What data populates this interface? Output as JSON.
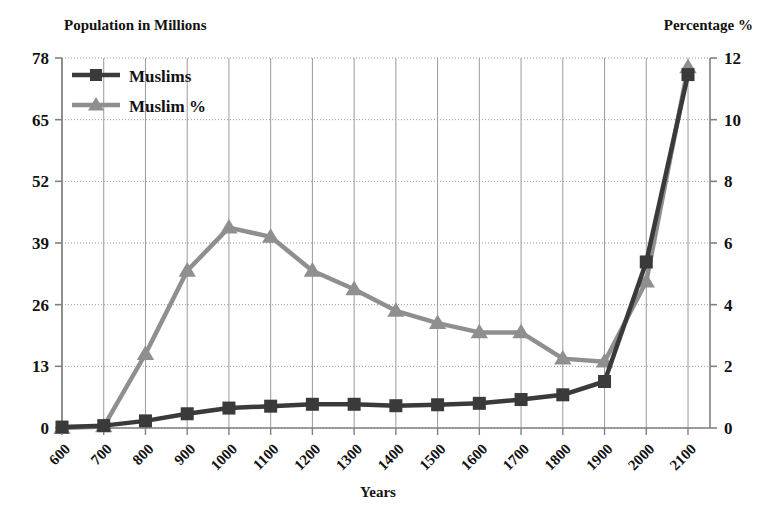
{
  "chart_data": {
    "type": "line",
    "title": "",
    "xlabel": "Years",
    "left_axis_title": "Population in Millions",
    "right_axis_title": "Percentage %",
    "categories": [
      "600",
      "700",
      "800",
      "900",
      "1000",
      "1100",
      "1200",
      "1300",
      "1400",
      "1500",
      "1600",
      "1700",
      "1800",
      "1900",
      "2000",
      "2100"
    ],
    "left_ticks": [
      "0",
      "13",
      "26",
      "39",
      "52",
      "65",
      "78"
    ],
    "right_ticks": [
      "0",
      "2",
      "4",
      "6",
      "8",
      "10",
      "12"
    ],
    "ylim": [
      0,
      78
    ],
    "y2lim": [
      0,
      12
    ],
    "grid": true,
    "legend_position": "top-left",
    "series": [
      {
        "name": "Muslims",
        "axis": "left",
        "marker": "square",
        "color": "#3a3a3a",
        "values": [
          0.2,
          0.5,
          1.5,
          3.0,
          4.2,
          4.6,
          5.0,
          5.0,
          4.7,
          4.9,
          5.2,
          6.0,
          7.0,
          9.8,
          35.0,
          74.5
        ]
      },
      {
        "name": "Muslim %",
        "axis": "right",
        "marker": "triangle",
        "color": "#8f8f8f",
        "values": [
          0.0,
          0.05,
          2.4,
          5.1,
          6.5,
          6.2,
          5.1,
          4.5,
          3.8,
          3.4,
          3.1,
          3.1,
          2.25,
          2.15,
          4.75,
          11.7
        ]
      }
    ]
  },
  "legend": {
    "items": [
      {
        "label": "Muslims"
      },
      {
        "label": "Muslim %"
      }
    ]
  },
  "colors": {
    "series_muslims": "#3a3a3a",
    "series_muslim_pct": "#8f8f8f",
    "axis": "#808080",
    "gridline": "#9a9a9a",
    "text": "#121212",
    "background": "#ffffff"
  }
}
